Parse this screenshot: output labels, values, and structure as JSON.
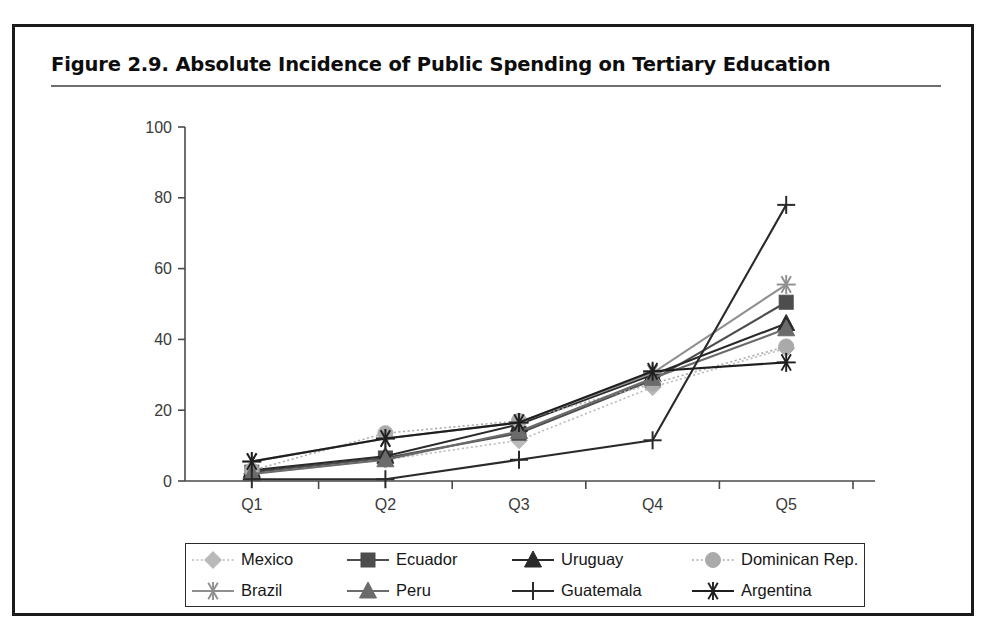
{
  "figure": {
    "title": "Figure 2.9.  Absolute Incidence of Public Spending on Tertiary Education"
  },
  "chart_data": {
    "type": "line",
    "title": "Figure 2.9.  Absolute Incidence of Public Spending on Tertiary Education",
    "xlabel": "",
    "ylabel": "",
    "categories": [
      "Q1",
      "Q2",
      "Q3",
      "Q4",
      "Q5"
    ],
    "ylim": [
      0,
      100
    ],
    "yticks": [
      0,
      20,
      40,
      60,
      80,
      100
    ],
    "ytick_labels": [
      "0",
      "20",
      "40",
      "60",
      "80",
      "100"
    ],
    "grid": false,
    "legend_position": "bottom",
    "series": [
      {
        "name": "Mexico",
        "values": [
          2.0,
          6.0,
          11.5,
          26.5,
          37.5
        ],
        "color": "#b9b9b9",
        "marker": "diamond",
        "line": "dotted"
      },
      {
        "name": "Ecuador",
        "values": [
          2.5,
          6.5,
          13.5,
          28.5,
          50.5
        ],
        "color": "#4d4d4d",
        "marker": "square",
        "line": "solid"
      },
      {
        "name": "Uruguay",
        "values": [
          3.0,
          7.0,
          16.0,
          30.0,
          44.5
        ],
        "color": "#2a2a2a",
        "marker": "triangle",
        "line": "solid"
      },
      {
        "name": "Dominican Rep.",
        "values": [
          3.0,
          13.5,
          17.0,
          27.5,
          38.0
        ],
        "color": "#aaaaaa",
        "marker": "circle",
        "line": "dotted"
      },
      {
        "name": "Brazil",
        "values": [
          5.5,
          12.0,
          16.5,
          30.5,
          55.5
        ],
        "color": "#8f8f8f",
        "marker": "star",
        "line": "solid"
      },
      {
        "name": "Peru",
        "values": [
          2.0,
          6.0,
          14.0,
          29.0,
          43.0
        ],
        "color": "#6b6b6b",
        "marker": "triangle",
        "line": "solid"
      },
      {
        "name": "Guatemala",
        "values": [
          0.5,
          0.5,
          6.0,
          11.5,
          78.0
        ],
        "color": "#2a2a2a",
        "marker": "plus",
        "line": "solid"
      },
      {
        "name": "Argentina",
        "values": [
          5.5,
          12.0,
          16.5,
          31.0,
          33.5
        ],
        "color": "#1f1f1f",
        "marker": "star",
        "line": "solid"
      }
    ]
  },
  "legend": {
    "items": [
      {
        "label": "Mexico"
      },
      {
        "label": "Ecuador"
      },
      {
        "label": "Uruguay"
      },
      {
        "label": "Dominican Rep."
      },
      {
        "label": "Brazil"
      },
      {
        "label": "Peru"
      },
      {
        "label": "Guatemala"
      },
      {
        "label": "Argentina"
      }
    ]
  }
}
